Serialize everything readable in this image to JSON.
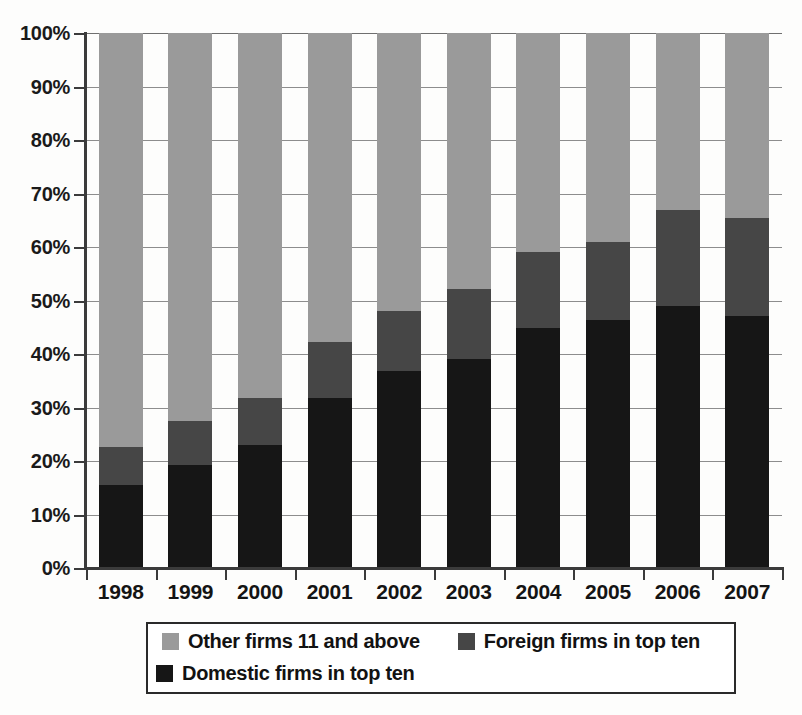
{
  "chart_data": {
    "type": "bar",
    "subtype": "stacked-bar-100-percent",
    "title": "",
    "xlabel": "",
    "ylabel": "",
    "ylim": [
      0,
      100
    ],
    "y_unit": "%",
    "grid": true,
    "legend_position": "bottom",
    "categories": [
      "1998",
      "1999",
      "2000",
      "2001",
      "2002",
      "2003",
      "2004",
      "2005",
      "2006",
      "2007"
    ],
    "yticks": [
      0,
      10,
      20,
      30,
      40,
      50,
      60,
      70,
      80,
      90,
      100
    ],
    "ytick_labels": [
      "0%",
      "10%",
      "20%",
      "30%",
      "40%",
      "50%",
      "60%",
      "70%",
      "80%",
      "90%",
      "100%"
    ],
    "series": [
      {
        "name": "Domestic firms in top ten",
        "color": "#161616",
        "values": [
          15.5,
          19.3,
          23.0,
          31.8,
          36.8,
          39.1,
          44.9,
          46.4,
          49.0,
          47.1
        ]
      },
      {
        "name": "Foreign firms in top ten",
        "color": "#464646",
        "values": [
          7.1,
          8.2,
          8.8,
          10.4,
          11.2,
          13.0,
          14.2,
          14.5,
          17.9,
          18.4
        ]
      },
      {
        "name": "Other firms 11 and above",
        "color": "#9a9a9a",
        "values": [
          77.4,
          72.5,
          68.2,
          57.8,
          52.0,
          47.9,
          40.9,
          39.1,
          33.1,
          34.5
        ]
      }
    ],
    "cumulative_tops": {
      "domestic": [
        15.5,
        19.3,
        23.0,
        31.8,
        36.8,
        39.1,
        44.9,
        46.4,
        49.0,
        47.1
      ],
      "domestic_plus_foreign": [
        22.6,
        27.5,
        31.8,
        42.2,
        48.0,
        52.1,
        59.1,
        60.9,
        66.9,
        65.5
      ],
      "total": [
        100,
        100,
        100,
        100,
        100,
        100,
        100,
        100,
        100,
        100
      ]
    }
  },
  "legend": {
    "entries": [
      {
        "label": "Other firms 11 and above",
        "color": "#9a9a9a"
      },
      {
        "label": "Foreign firms in top ten",
        "color": "#464646"
      },
      {
        "label": "Domestic firms in top ten",
        "color": "#161616"
      }
    ]
  }
}
